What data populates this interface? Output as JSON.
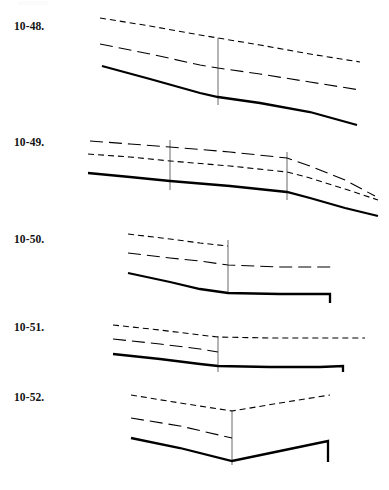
{
  "page": {
    "width": 389,
    "height": 490,
    "background": "#ffffff",
    "ink_color": "#000000",
    "label_color": "#121212"
  },
  "chart_data": [
    {
      "type": "line",
      "id": "fig-10-48",
      "title": "10-48.",
      "xlabel": "",
      "ylabel": "",
      "grid": false,
      "legend": "none",
      "axis_visible": false,
      "xlim": [
        0,
        389
      ],
      "ylim": [
        0,
        130
      ],
      "note": "Three downward-sloping curves (solid, long-dash, short-dash) with one thin vertical reference line.",
      "series": [
        {
          "name": "upper-short-dash",
          "style": "short-dash",
          "width": 1.1,
          "points": [
            [
              100,
              18
            ],
            [
              150,
              26
            ],
            [
              200,
              35
            ],
            [
              218,
              38
            ],
            [
              260,
              45
            ],
            [
              310,
              54
            ],
            [
              360,
              62
            ]
          ]
        },
        {
          "name": "middle-long-dash",
          "style": "long-dash",
          "width": 1.1,
          "points": [
            [
              100,
              44
            ],
            [
              150,
              54
            ],
            [
              200,
              65
            ],
            [
              218,
              68
            ],
            [
              260,
              74
            ],
            [
              310,
              82
            ],
            [
              360,
              90
            ]
          ]
        },
        {
          "name": "lower-solid",
          "style": "solid",
          "width": 2.3,
          "points": [
            [
              102,
              66
            ],
            [
              150,
              79
            ],
            [
              200,
              93
            ],
            [
              218,
              97
            ],
            [
              260,
              103
            ],
            [
              310,
              112
            ],
            [
              357,
              125
            ]
          ]
        }
      ],
      "reference_lines": [
        {
          "name": "vertical-marker-1",
          "x": 218,
          "y1": 38,
          "y2": 105,
          "width": 0.9
        }
      ]
    },
    {
      "type": "line",
      "id": "fig-10-49",
      "title": "10-49.",
      "xlabel": "",
      "ylabel": "",
      "grid": false,
      "legend": "none",
      "axis_visible": false,
      "xlim": [
        0,
        389
      ],
      "ylim": [
        130,
        225
      ],
      "note": "Three gently sloping curves that steepen after the second vertical marker; two thin vertical reference lines.",
      "series": [
        {
          "name": "upper-long-dash",
          "style": "long-dash",
          "width": 1.1,
          "points": [
            [
              90,
              141
            ],
            [
              130,
              144
            ],
            [
              170,
              147
            ],
            [
              230,
              152
            ],
            [
              287,
              158
            ],
            [
              310,
              166
            ],
            [
              345,
              180
            ],
            [
              375,
              196
            ]
          ]
        },
        {
          "name": "middle-short-dash",
          "style": "short-dash",
          "width": 1.1,
          "points": [
            [
              88,
              154
            ],
            [
              130,
              157
            ],
            [
              170,
              161
            ],
            [
              230,
              166
            ],
            [
              287,
              172
            ],
            [
              310,
              178
            ],
            [
              345,
              189
            ],
            [
              378,
              200
            ]
          ]
        },
        {
          "name": "lower-solid",
          "style": "solid",
          "width": 2.3,
          "points": [
            [
              88,
              173
            ],
            [
              130,
              177
            ],
            [
              170,
              181
            ],
            [
              230,
              186
            ],
            [
              287,
              192
            ],
            [
              310,
              198
            ],
            [
              345,
              208
            ],
            [
              378,
              216
            ]
          ]
        }
      ],
      "reference_lines": [
        {
          "name": "vertical-marker-1",
          "x": 170,
          "y1": 140,
          "y2": 190,
          "width": 0.9
        },
        {
          "name": "vertical-marker-2",
          "x": 287,
          "y1": 152,
          "y2": 200,
          "width": 0.9
        }
      ]
    },
    {
      "type": "line",
      "id": "fig-10-50",
      "title": "10-50.",
      "xlabel": "",
      "ylabel": "",
      "grid": false,
      "legend": "none",
      "axis_visible": false,
      "xlim": [
        0,
        389
      ],
      "ylim": [
        225,
        315
      ],
      "note": "Short-dash curve terminates at the vertical marker; long-dash flattens past it; solid line flattens then steps down at the right end.",
      "series": [
        {
          "name": "upper-short-dash",
          "style": "short-dash",
          "width": 1.1,
          "points": [
            [
              128,
              234
            ],
            [
              170,
              239
            ],
            [
              200,
              243
            ],
            [
              228,
              246
            ]
          ]
        },
        {
          "name": "middle-long-dash",
          "style": "long-dash",
          "width": 1.1,
          "points": [
            [
              128,
              253
            ],
            [
              170,
              258
            ],
            [
              200,
              261
            ],
            [
              228,
              265
            ],
            [
              280,
              267
            ],
            [
              335,
              267
            ]
          ]
        },
        {
          "name": "lower-solid",
          "style": "solid",
          "width": 2.3,
          "points": [
            [
              128,
              273
            ],
            [
              170,
              282
            ],
            [
              200,
              289
            ],
            [
              228,
              293
            ],
            [
              280,
              294
            ],
            [
              330,
              294
            ],
            [
              330,
              303
            ]
          ]
        }
      ],
      "reference_lines": [
        {
          "name": "vertical-marker-1",
          "x": 228,
          "y1": 240,
          "y2": 293,
          "width": 0.9
        }
      ]
    },
    {
      "type": "line",
      "id": "fig-10-51",
      "title": "10-51.",
      "xlabel": "",
      "ylabel": "",
      "grid": false,
      "legend": "none",
      "axis_visible": false,
      "xlim": [
        0,
        389
      ],
      "ylim": [
        315,
        385
      ],
      "note": "Short-dash and long-dash converge at the vertical marker then run flat; solid line flattens and steps down at the right end.",
      "series": [
        {
          "name": "upper-short-dash",
          "style": "short-dash",
          "width": 1.1,
          "points": [
            [
              113,
              325
            ],
            [
              160,
              330
            ],
            [
              200,
              335
            ],
            [
              218,
              337
            ],
            [
              270,
              338
            ],
            [
              320,
              338
            ],
            [
              365,
              338
            ]
          ]
        },
        {
          "name": "middle-long-dash",
          "style": "long-dash",
          "width": 1.1,
          "points": [
            [
              113,
              339
            ],
            [
              160,
              344
            ],
            [
              200,
              349
            ],
            [
              218,
              352
            ]
          ]
        },
        {
          "name": "lower-solid",
          "style": "solid",
          "width": 2.3,
          "points": [
            [
              113,
              354
            ],
            [
              160,
              359
            ],
            [
              200,
              364
            ],
            [
              218,
              366
            ],
            [
              270,
              367
            ],
            [
              320,
              367
            ],
            [
              343,
              366
            ],
            [
              343,
              372
            ]
          ]
        }
      ],
      "reference_lines": [
        {
          "name": "vertical-marker-1",
          "x": 218,
          "y1": 336,
          "y2": 372,
          "width": 0.9
        }
      ]
    },
    {
      "type": "line",
      "id": "fig-10-52",
      "title": "10-52.",
      "xlabel": "",
      "ylabel": "",
      "grid": false,
      "legend": "none",
      "axis_visible": false,
      "xlim": [
        0,
        389
      ],
      "ylim": [
        385,
        490
      ],
      "note": "V-shaped profile: all three curves descend to a minimum at the vertical marker then rise; solid line steps down at the right end.",
      "series": [
        {
          "name": "upper-short-dash",
          "style": "short-dash",
          "width": 1.1,
          "points": [
            [
              131,
              395
            ],
            [
              180,
              403
            ],
            [
              232,
              411
            ],
            [
              280,
              403
            ],
            [
              330,
              395
            ]
          ]
        },
        {
          "name": "middle-long-dash",
          "style": "long-dash",
          "width": 1.1,
          "points": [
            [
              131,
              418
            ],
            [
              180,
              426
            ],
            [
              232,
              438
            ]
          ]
        },
        {
          "name": "lower-solid",
          "style": "solid",
          "width": 2.3,
          "points": [
            [
              131,
              438
            ],
            [
              180,
              448
            ],
            [
              232,
              461
            ],
            [
              280,
              451
            ],
            [
              328,
              441
            ],
            [
              328,
              462
            ]
          ]
        }
      ],
      "reference_lines": [
        {
          "name": "vertical-marker-1",
          "x": 232,
          "y1": 410,
          "y2": 465,
          "width": 0.9
        }
      ]
    }
  ],
  "labels": {
    "fig_10_48": "10-48.",
    "fig_10_49": "10-49.",
    "fig_10_50": "10-50.",
    "fig_10_51": "10-51.",
    "fig_10_52": "10-52."
  },
  "label_positions": {
    "fig_10_48": 21,
    "fig_10_49": 137,
    "fig_10_50": 234,
    "fig_10_51": 322,
    "fig_10_52": 392
  }
}
